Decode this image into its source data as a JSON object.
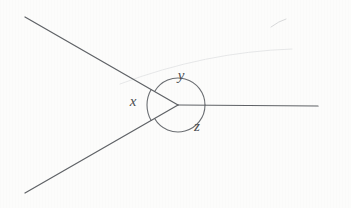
{
  "figure": {
    "kind": "geometry-diagram",
    "canvas": {
      "width": 351,
      "height": 208
    },
    "background_color": "#fcfcfb",
    "ink_color": "#5f6266",
    "arc_color": "#6b6e72",
    "label_color": "#4a4d50",
    "vertex": {
      "x": 178,
      "y": 105
    },
    "rays": [
      {
        "name": "upper-left-ray",
        "from": {
          "x": 178,
          "y": 105
        },
        "to": {
          "x": 25,
          "y": 17
        },
        "direction_degrees": 150
      },
      {
        "name": "lower-left-ray",
        "from": {
          "x": 178,
          "y": 105
        },
        "to": {
          "x": 25,
          "y": 193
        },
        "direction_degrees": 210
      },
      {
        "name": "right-ray",
        "from": {
          "x": 178,
          "y": 105
        },
        "to": {
          "x": 318,
          "y": 106
        },
        "direction_degrees": 0
      }
    ],
    "angles": [
      {
        "id": "x",
        "label": "x",
        "label_position": {
          "x": 133,
          "y": 103
        },
        "between": [
          "lower-left-ray",
          "upper-left-ray"
        ],
        "arc": {
          "radius": 31,
          "start_degrees": 210,
          "end_degrees": 150
        }
      },
      {
        "id": "y",
        "label": "y",
        "label_position": {
          "x": 181,
          "y": 77
        },
        "between": [
          "upper-left-ray",
          "right-ray"
        ],
        "arc": {
          "radius": 27,
          "start_degrees": 150,
          "end_degrees": 0
        }
      },
      {
        "id": "z",
        "label": "z",
        "label_position": {
          "x": 197,
          "y": 128
        },
        "between": [
          "right-ray",
          "lower-left-ray"
        ],
        "arc": {
          "radius": 27,
          "start_degrees": 0,
          "end_degrees": 210
        }
      }
    ],
    "artifacts": [
      {
        "name": "stray-pencil-mark",
        "from": {
          "x": 271,
          "y": 27
        },
        "to": {
          "x": 286,
          "y": 19
        }
      },
      {
        "name": "faint-scan-sweep",
        "from": {
          "x": 120,
          "y": 84
        },
        "to": {
          "x": 292,
          "y": 49
        }
      }
    ]
  }
}
